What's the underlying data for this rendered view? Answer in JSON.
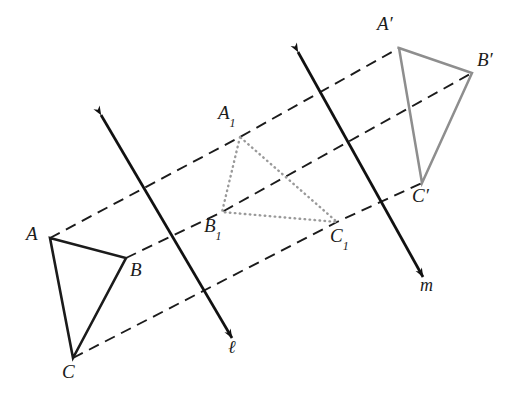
{
  "figure": {
    "width": 508,
    "height": 407,
    "background": "#ffffff"
  },
  "colors": {
    "preimage_stroke": "#1b1b1b",
    "intermediate_stroke": "#9a9a9a",
    "image_stroke": "#8e8e8e",
    "line_stroke": "#111111",
    "dashed_stroke": "#1b1b1b",
    "label_text": "#1b1b1b"
  },
  "triangles": {
    "preimage": {
      "name": "triangle-abc",
      "style": "solid-dark",
      "vertices": [
        {
          "label": "A",
          "sub": "",
          "x": 50,
          "y": 238,
          "label_x": 26,
          "label_y": 224
        },
        {
          "label": "B",
          "sub": "",
          "x": 126,
          "y": 258,
          "label_x": 130,
          "label_y": 260
        },
        {
          "label": "C",
          "sub": "",
          "x": 73,
          "y": 358,
          "label_x": 62,
          "label_y": 362
        }
      ]
    },
    "intermediate": {
      "name": "triangle-a1b1c1",
      "style": "dotted-gray",
      "vertices": [
        {
          "label": "A",
          "sub": "1",
          "x": 240,
          "y": 137,
          "label_x": 218,
          "label_y": 103
        },
        {
          "label": "B",
          "sub": "1",
          "x": 222,
          "y": 212,
          "label_x": 204,
          "label_y": 216
        },
        {
          "label": "C",
          "sub": "1",
          "x": 337,
          "y": 222,
          "label_x": 330,
          "label_y": 226
        }
      ]
    },
    "image": {
      "name": "triangle-a-prime-b-prime-c-prime",
      "style": "solid-gray",
      "vertices": [
        {
          "label": "A′",
          "sub": "",
          "x": 399,
          "y": 48,
          "label_x": 377,
          "label_y": 14
        },
        {
          "label": "B′",
          "sub": "",
          "x": 472,
          "y": 73,
          "label_x": 477,
          "label_y": 50
        },
        {
          "label": "C′",
          "sub": "",
          "x": 422,
          "y": 183,
          "label_x": 412,
          "label_y": 186
        }
      ]
    }
  },
  "mirror_lines": [
    {
      "name": "line-l",
      "label": "ℓ",
      "x1": 101,
      "y1": 115,
      "x2": 232,
      "y2": 338,
      "label_x": 228,
      "label_y": 338
    },
    {
      "name": "line-m",
      "label": "m",
      "x1": 298,
      "y1": 52,
      "x2": 423,
      "y2": 277,
      "label_x": 420,
      "label_y": 276
    }
  ],
  "dashed_paths": [
    {
      "name": "dashed-path-a",
      "points": "50,238 240,137 399,48"
    },
    {
      "name": "dashed-path-b",
      "points": "126,258 222,212 472,73"
    },
    {
      "name": "dashed-path-c",
      "points": "73,358 337,222 422,183"
    }
  ]
}
